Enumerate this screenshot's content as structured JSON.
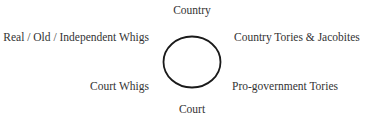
{
  "diagram": {
    "axis": {
      "top": "Country",
      "bottom": "Court"
    },
    "quadrants": {
      "top_left": "Real / Old / Independent Whigs",
      "top_right": "Country Tories & Jacobites",
      "bottom_left": "Court Whigs",
      "bottom_right": "Pro-government Tories"
    },
    "center_shape": "ellipse",
    "colors": {
      "text": "#333333",
      "stroke": "#1a1a1a",
      "background": "#ffffff"
    }
  }
}
